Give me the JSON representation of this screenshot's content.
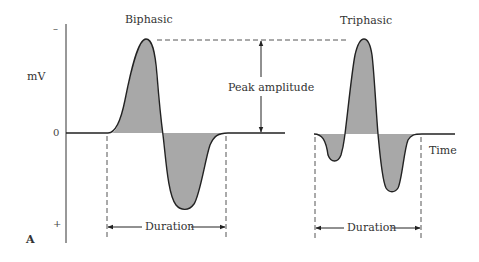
{
  "figure": {
    "panel_label": "A",
    "y_axis_label": "mV",
    "y_ticks": {
      "top": "–",
      "zero": "0",
      "bottom": "+"
    },
    "x_axis_label": "Time",
    "colors": {
      "fill": "#a8a8a8",
      "stroke": "#222222",
      "text": "#333333",
      "dash": "#555555"
    }
  },
  "waveforms": [
    {
      "title": "Biphasic",
      "duration_label": "Duration"
    },
    {
      "title": "Triphasic",
      "duration_label": "Duration"
    }
  ],
  "annotations": {
    "peak_amplitude": "Peak amplitude"
  }
}
